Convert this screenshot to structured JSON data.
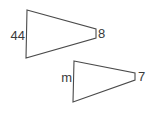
{
  "colors": {
    "background": "#ffffff",
    "line": "#4a4a4a",
    "text": "#3a3a3a"
  },
  "shapes": {
    "large": {
      "points": "27,10 96,29 96,38 26,58",
      "left_label": "44",
      "right_label": "8"
    },
    "small": {
      "points": "74,61 135,73 135,80 73,102",
      "left_label": "m",
      "right_label": "7"
    }
  }
}
